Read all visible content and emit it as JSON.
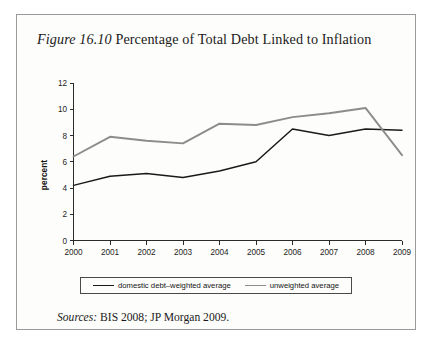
{
  "figure": {
    "label": "Figure 16.10",
    "title_rest": " Percentage of Total Debt Linked to Inflation",
    "sources_label": "Sources:",
    "sources_text": " BIS 2008; JP Morgan 2009.",
    "border_color": "#9a9a9a",
    "background_color": "#fdfdfb"
  },
  "legend": {
    "items": [
      {
        "label": "domestic debt–weighted average",
        "color": "#1a1a1a"
      },
      {
        "label": "unweighted average",
        "color": "#8c8c8c"
      }
    ]
  },
  "chart_data": {
    "type": "line",
    "title": "Figure 16.10 Percentage of Total Debt Linked to Inflation",
    "xlabel": "",
    "ylabel": "percent",
    "x": [
      2000,
      2001,
      2002,
      2003,
      2004,
      2005,
      2006,
      2007,
      2008,
      2009
    ],
    "xtick_labels": [
      "2000",
      "2001",
      "2002",
      "2003",
      "2004",
      "2005",
      "2006",
      "2007",
      "2008",
      "2009"
    ],
    "ytick_labels": [
      "0",
      "2",
      "4",
      "6",
      "8",
      "10",
      "12"
    ],
    "yticks": [
      0,
      2,
      4,
      6,
      8,
      10,
      12
    ],
    "ylim": [
      0,
      12
    ],
    "grid": false,
    "legend_position": "bottom",
    "series": [
      {
        "name": "domestic debt–weighted average",
        "color": "#1a1a1a",
        "values": [
          4.2,
          4.9,
          5.1,
          4.8,
          5.3,
          6.0,
          8.5,
          8.0,
          8.5,
          8.4
        ]
      },
      {
        "name": "unweighted average",
        "color": "#8c8c8c",
        "values": [
          6.4,
          7.9,
          7.6,
          7.4,
          8.9,
          8.8,
          9.4,
          9.7,
          10.1,
          6.5
        ]
      }
    ]
  }
}
